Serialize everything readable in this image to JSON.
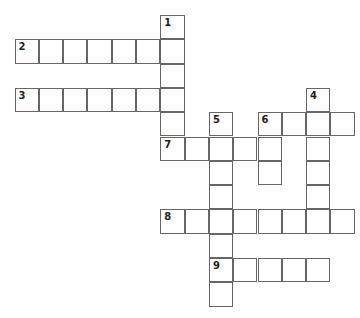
{
  "puzzle": {
    "type": "crossword",
    "origin": {
      "x": 15,
      "y": 15.5
    },
    "cell_size": 24.3,
    "entries": [
      {
        "number": "1",
        "direction": "down",
        "col": 6,
        "row": 0,
        "length": 6
      },
      {
        "number": "2",
        "direction": "across",
        "col": 0,
        "row": 1,
        "length": 7
      },
      {
        "number": "3",
        "direction": "across",
        "col": 0,
        "row": 3,
        "length": 7
      },
      {
        "number": "4",
        "direction": "down",
        "col": 12,
        "row": 3,
        "length": 6
      },
      {
        "number": "5",
        "direction": "down",
        "col": 8,
        "row": 4,
        "length": 8
      },
      {
        "number": "6",
        "direction": "across",
        "col": 10,
        "row": 4,
        "length": 4
      },
      {
        "number": "6",
        "direction": "down",
        "col": 10,
        "row": 4,
        "length": 3
      },
      {
        "number": "7",
        "direction": "across",
        "col": 6,
        "row": 5,
        "length": 4
      },
      {
        "number": "8",
        "direction": "across",
        "col": 6,
        "row": 8,
        "length": 8
      },
      {
        "number": "9",
        "direction": "across",
        "col": 8,
        "row": 10,
        "length": 5
      }
    ],
    "border_color": "#666666",
    "number_color": "#222222"
  }
}
